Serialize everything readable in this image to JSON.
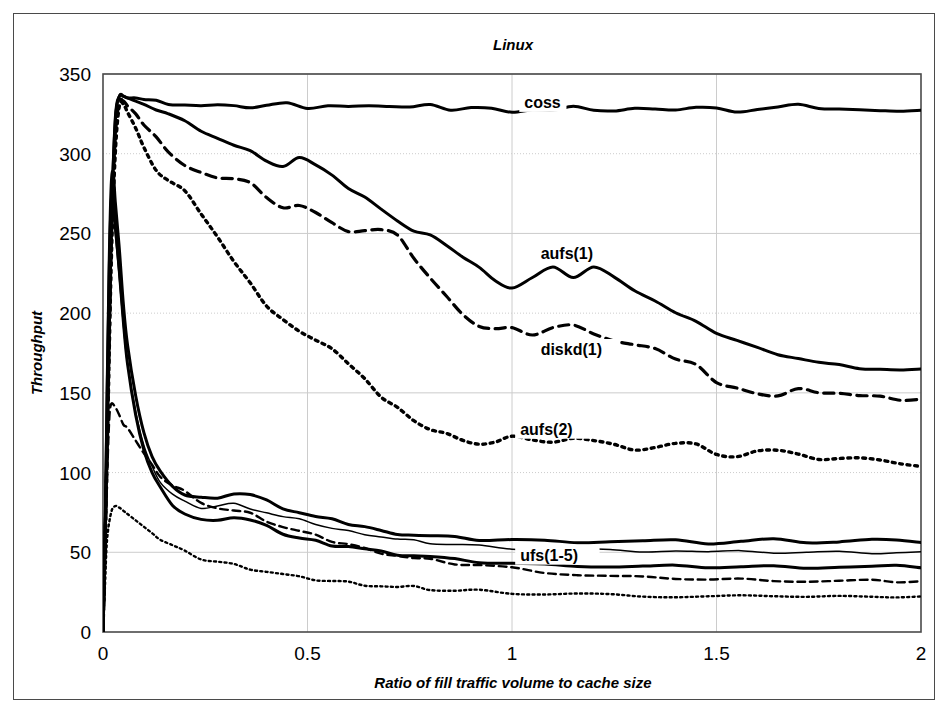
{
  "chart_data": {
    "type": "line",
    "title": "Linux",
    "xlabel": "Ratio of fill traffic volume to cache size",
    "ylabel": "Throughput",
    "xlim": [
      0,
      2
    ],
    "ylim": [
      0,
      350
    ],
    "xticks": [
      0,
      0.5,
      1,
      1.5,
      2
    ],
    "xtick_labels": [
      "0",
      "0.5",
      "1",
      "1.5",
      "2"
    ],
    "yticks": [
      0,
      50,
      100,
      150,
      200,
      250,
      300,
      350
    ],
    "ytick_labels": [
      "0",
      "50",
      "100",
      "150",
      "200",
      "250",
      "300",
      "350"
    ],
    "grid": true,
    "legend_position": "inline-annotations",
    "series": [
      {
        "name": "coss",
        "style": "solid",
        "width": 3.0,
        "label_x": 1.03,
        "label_y": 330,
        "x": [
          0,
          0.01,
          0.02,
          0.03,
          0.04,
          0.05,
          0.06,
          0.08,
          0.1,
          0.13,
          0.16,
          0.2,
          0.24,
          0.28,
          0.32,
          0.36,
          0.4,
          0.45,
          0.5,
          0.55,
          0.6,
          0.65,
          0.7,
          0.75,
          0.8,
          0.85,
          0.9,
          0.95,
          1.0,
          1.05,
          1.1,
          1.15,
          1.2,
          1.25,
          1.3,
          1.35,
          1.4,
          1.45,
          1.5,
          1.55,
          1.6,
          1.65,
          1.7,
          1.75,
          1.8,
          1.85,
          1.9,
          1.95,
          2.0
        ],
        "y": [
          0,
          120,
          250,
          320,
          336,
          336,
          335,
          335,
          334,
          333,
          332,
          331,
          330,
          330,
          331,
          329,
          330,
          331,
          329,
          330,
          329,
          331,
          330,
          329,
          330,
          328,
          329,
          328,
          327,
          328,
          327,
          329,
          328,
          327,
          328,
          327,
          328,
          329,
          328,
          327,
          328,
          329,
          330,
          329,
          328,
          327,
          328,
          327,
          327
        ]
      },
      {
        "name": "aufs(1)",
        "style": "solid",
        "width": 3.0,
        "label_x": 1.07,
        "label_y": 235,
        "x": [
          0,
          0.01,
          0.02,
          0.03,
          0.04,
          0.05,
          0.06,
          0.08,
          0.1,
          0.13,
          0.16,
          0.2,
          0.24,
          0.28,
          0.32,
          0.36,
          0.4,
          0.44,
          0.48,
          0.52,
          0.56,
          0.6,
          0.64,
          0.68,
          0.72,
          0.76,
          0.8,
          0.84,
          0.88,
          0.92,
          0.96,
          1.0,
          1.05,
          1.1,
          1.15,
          1.2,
          1.25,
          1.3,
          1.35,
          1.4,
          1.45,
          1.5,
          1.55,
          1.6,
          1.65,
          1.7,
          1.75,
          1.8,
          1.85,
          1.9,
          1.95,
          2.0
        ],
        "y": [
          0,
          120,
          250,
          322,
          336,
          336,
          335,
          333,
          331,
          328,
          325,
          320,
          315,
          310,
          305,
          301,
          296,
          292,
          297,
          294,
          287,
          278,
          272,
          266,
          258,
          251,
          248,
          243,
          235,
          228,
          221,
          216,
          222,
          228,
          223,
          229,
          222,
          215,
          208,
          200,
          194,
          188,
          183,
          178,
          175,
          172,
          169,
          167,
          166,
          165,
          164,
          164
        ]
      },
      {
        "name": "diskd(1)",
        "style": "dashed",
        "width": 3.2,
        "label_x": 1.07,
        "label_y": 175,
        "x": [
          0,
          0.01,
          0.02,
          0.03,
          0.04,
          0.05,
          0.06,
          0.08,
          0.1,
          0.13,
          0.16,
          0.2,
          0.24,
          0.28,
          0.32,
          0.36,
          0.4,
          0.44,
          0.48,
          0.52,
          0.56,
          0.6,
          0.64,
          0.68,
          0.72,
          0.76,
          0.8,
          0.84,
          0.88,
          0.92,
          0.96,
          1.0,
          1.05,
          1.1,
          1.15,
          1.2,
          1.25,
          1.3,
          1.35,
          1.4,
          1.45,
          1.5,
          1.55,
          1.6,
          1.65,
          1.7,
          1.75,
          1.8,
          1.85,
          1.9,
          1.95,
          2.0
        ],
        "y": [
          0,
          115,
          240,
          310,
          332,
          333,
          330,
          325,
          318,
          310,
          302,
          293,
          288,
          284,
          285,
          282,
          272,
          265,
          268,
          263,
          256,
          252,
          252,
          252,
          248,
          235,
          222,
          210,
          200,
          192,
          190,
          190,
          187,
          191,
          192,
          188,
          183,
          180,
          177,
          172,
          168,
          156,
          152,
          150,
          148,
          152,
          151,
          150,
          148,
          147,
          146,
          146
        ]
      },
      {
        "name": "aufs(2)",
        "style": "dotted",
        "width": 3.4,
        "label_x": 1.02,
        "label_y": 125,
        "x": [
          0,
          0.01,
          0.02,
          0.03,
          0.04,
          0.05,
          0.06,
          0.08,
          0.1,
          0.13,
          0.16,
          0.2,
          0.24,
          0.28,
          0.32,
          0.36,
          0.4,
          0.44,
          0.48,
          0.52,
          0.56,
          0.6,
          0.64,
          0.68,
          0.72,
          0.76,
          0.8,
          0.84,
          0.88,
          0.92,
          0.96,
          1.0,
          1.05,
          1.1,
          1.15,
          1.2,
          1.25,
          1.3,
          1.35,
          1.4,
          1.45,
          1.5,
          1.55,
          1.6,
          1.65,
          1.7,
          1.75,
          1.8,
          1.85,
          1.9,
          1.95,
          2.0
        ],
        "y": [
          0,
          110,
          230,
          300,
          330,
          331,
          326,
          316,
          304,
          290,
          283,
          276,
          263,
          248,
          232,
          218,
          205,
          196,
          188,
          184,
          178,
          168,
          158,
          148,
          141,
          132,
          128,
          125,
          120,
          117,
          120,
          123,
          120,
          118,
          122,
          120,
          117,
          115,
          116,
          118,
          117,
          112,
          110,
          113,
          115,
          112,
          108,
          108,
          110,
          108,
          105,
          105
        ]
      },
      {
        "name": "ufs(1-5)",
        "style": "solid",
        "width": 3.0,
        "label_x": 1.02,
        "label_y": 46,
        "is_group_label": true,
        "x": [
          0,
          0.005,
          0.01,
          0.015,
          0.02,
          0.025,
          0.03,
          0.04,
          0.05,
          0.06,
          0.08,
          0.1,
          0.12,
          0.14,
          0.17,
          0.2,
          0.24,
          0.28,
          0.32,
          0.36,
          0.4,
          0.44,
          0.48,
          0.52,
          0.56,
          0.6,
          0.64,
          0.68,
          0.72,
          0.76,
          0.8,
          0.86,
          0.92,
          1.0,
          1.08,
          1.16,
          1.24,
          1.32,
          1.4,
          1.48,
          1.56,
          1.64,
          1.72,
          1.8,
          1.88,
          1.94,
          2.0
        ],
        "y": [
          0,
          60,
          150,
          230,
          280,
          288,
          270,
          240,
          205,
          180,
          148,
          125,
          110,
          100,
          92,
          86,
          84,
          85,
          87,
          86,
          82,
          78,
          75,
          72,
          70,
          68,
          66,
          63,
          62,
          61,
          60,
          59,
          58,
          58,
          57,
          57,
          57,
          57,
          57,
          56,
          57,
          58,
          57,
          57,
          58,
          57,
          57
        ]
      },
      {
        "name": "ufs-2",
        "style": "solid",
        "width": 1.5,
        "x": [
          0,
          0.005,
          0.01,
          0.015,
          0.02,
          0.025,
          0.03,
          0.04,
          0.05,
          0.06,
          0.08,
          0.1,
          0.12,
          0.14,
          0.17,
          0.2,
          0.24,
          0.28,
          0.32,
          0.36,
          0.4,
          0.44,
          0.48,
          0.52,
          0.56,
          0.6,
          0.64,
          0.68,
          0.72,
          0.76,
          0.8,
          0.86,
          0.92,
          1.0,
          1.08,
          1.16,
          1.24,
          1.32,
          1.4,
          1.48,
          1.56,
          1.64,
          1.72,
          1.8,
          1.88,
          1.94,
          2.0
        ],
        "y": [
          0,
          55,
          140,
          215,
          262,
          266,
          250,
          222,
          192,
          168,
          138,
          117,
          104,
          94,
          86,
          81,
          78,
          79,
          80,
          78,
          75,
          72,
          70,
          68,
          65,
          63,
          62,
          60,
          58,
          57,
          56,
          55,
          54,
          53,
          52,
          52,
          51,
          51,
          51,
          50,
          50,
          50,
          50,
          50,
          50,
          50,
          50
        ]
      },
      {
        "name": "ufs-3",
        "style": "solid",
        "width": 3.0,
        "x": [
          0,
          0.005,
          0.01,
          0.015,
          0.02,
          0.025,
          0.03,
          0.04,
          0.05,
          0.06,
          0.08,
          0.1,
          0.12,
          0.14,
          0.17,
          0.2,
          0.24,
          0.28,
          0.32,
          0.36,
          0.4,
          0.44,
          0.48,
          0.52,
          0.56,
          0.6,
          0.64,
          0.68,
          0.72,
          0.76,
          0.8,
          0.86,
          0.92,
          1.0,
          1.08,
          1.16,
          1.24,
          1.32,
          1.4,
          1.48,
          1.56,
          1.64,
          1.72,
          1.8,
          1.88,
          1.94,
          2.0
        ],
        "y": [
          0,
          58,
          145,
          222,
          270,
          272,
          255,
          226,
          194,
          168,
          136,
          114,
          100,
          90,
          80,
          74,
          70,
          71,
          72,
          70,
          66,
          62,
          59,
          57,
          55,
          54,
          52,
          50,
          49,
          48,
          47,
          45,
          44,
          43,
          42,
          42,
          41,
          41,
          41,
          41,
          41,
          41,
          41,
          41,
          41,
          41,
          41
        ]
      },
      {
        "name": "ufs-4",
        "style": "dashed",
        "width": 2.4,
        "x": [
          0,
          0.005,
          0.01,
          0.015,
          0.02,
          0.03,
          0.04,
          0.05,
          0.06,
          0.08,
          0.1,
          0.12,
          0.14,
          0.17,
          0.2,
          0.24,
          0.28,
          0.32,
          0.36,
          0.4,
          0.44,
          0.48,
          0.52,
          0.56,
          0.6,
          0.64,
          0.68,
          0.72,
          0.76,
          0.8,
          0.86,
          0.92,
          1.0,
          1.08,
          1.16,
          1.24,
          1.32,
          1.4,
          1.48,
          1.56,
          1.64,
          1.72,
          1.8,
          1.88,
          1.94,
          2.0
        ],
        "y": [
          0,
          40,
          95,
          132,
          143,
          141,
          136,
          130,
          128,
          120,
          112,
          105,
          98,
          92,
          88,
          82,
          78,
          76,
          74,
          70,
          66,
          63,
          60,
          57,
          55,
          52,
          50,
          48,
          46,
          45,
          43,
          42,
          40,
          38,
          36,
          35,
          34,
          34,
          33,
          33,
          33,
          32,
          32,
          32,
          32,
          32
        ]
      },
      {
        "name": "ufs-5",
        "style": "dotted",
        "width": 2.4,
        "x": [
          0,
          0.005,
          0.01,
          0.02,
          0.03,
          0.04,
          0.05,
          0.06,
          0.08,
          0.1,
          0.12,
          0.14,
          0.17,
          0.2,
          0.24,
          0.28,
          0.32,
          0.36,
          0.4,
          0.44,
          0.48,
          0.52,
          0.56,
          0.6,
          0.64,
          0.68,
          0.72,
          0.76,
          0.8,
          0.86,
          0.92,
          1.0,
          1.08,
          1.16,
          1.24,
          1.32,
          1.4,
          1.48,
          1.56,
          1.64,
          1.72,
          1.8,
          1.88,
          1.94,
          2.0
        ],
        "y": [
          0,
          30,
          58,
          75,
          79,
          78,
          76,
          74,
          70,
          66,
          62,
          58,
          54,
          50,
          46,
          44,
          42,
          40,
          38,
          36,
          34,
          33,
          32,
          31,
          30,
          29,
          28,
          28,
          27,
          26,
          26,
          25,
          24,
          24,
          23,
          23,
          22,
          22,
          22,
          23,
          22,
          22,
          23,
          22,
          22
        ]
      }
    ]
  },
  "figure": {
    "frame_color": "#4a4a4a",
    "grid_color": "#cccccc",
    "line_color": "#000000",
    "background": "#ffffff"
  }
}
